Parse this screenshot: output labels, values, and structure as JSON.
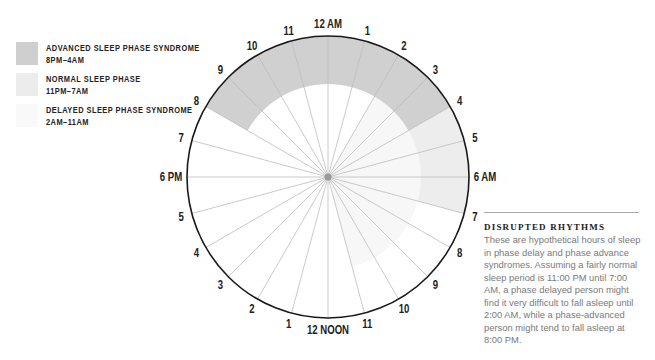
{
  "legend": {
    "items": [
      {
        "title": "ADVANCED SLEEP PHASE SYNDROME",
        "range": "8PM–4AM",
        "color": "#cfcfcf"
      },
      {
        "title": "NORMAL SLEEP PHASE",
        "range": "11PM–7AM",
        "color": "#ececec"
      },
      {
        "title": "DELAYED SLEEP PHASE SYNDROME",
        "range": "2AM–11AM",
        "color": "#f6f6f6"
      }
    ]
  },
  "clock": {
    "center": [
      328,
      177
    ],
    "radius": 141,
    "hour_labels": [
      "12 AM",
      "1",
      "2",
      "3",
      "4",
      "5",
      "6 AM",
      "7",
      "8",
      "9",
      "10",
      "11",
      "12 NOON",
      "1",
      "2",
      "3",
      "4",
      "5",
      "6 PM",
      "7",
      "8",
      "9",
      "10",
      "11"
    ],
    "bands": [
      {
        "name": "delayed",
        "start_hour": 2,
        "end_hour": 11,
        "r_inner": 0,
        "r_outer": 93,
        "color": "#f7f7f7"
      },
      {
        "name": "normal",
        "start_hour": 23,
        "end_hour": 7,
        "r_inner": 93,
        "r_outer": 141,
        "color": "#ededed"
      },
      {
        "name": "advanced",
        "start_hour": 20,
        "end_hour": 4,
        "r_inner": 93,
        "r_outer": 141,
        "color": "#d0d0d0"
      }
    ],
    "spoke_color": "#bdbdbd",
    "rim_color": "#1a1a1a"
  },
  "sidebar": {
    "title": "DISRUPTED RHYTHMS",
    "body": "These are hypothetical hours of sleep in phase delay and phase advance syndromes. Assuming a fairly normal sleep period is 11:00 PM until 7:00 AM, a phase delayed person might find it very difficult to fall asleep until 2:00 AM, while a phase-advanced person might tend to fall asleep at 8:00 PM."
  }
}
